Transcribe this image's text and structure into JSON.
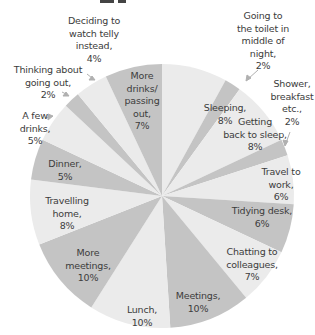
{
  "chart_data": {
    "type": "pie",
    "title": "",
    "start_angle": "12 o'clock",
    "direction": "clockwise",
    "colors": {
      "light": "#ebebeb",
      "dark": "#c4c4c4"
    },
    "categories": [
      "Sleeping",
      "Going to the toilet in middle of night",
      "Getting back to sleep",
      "Shower, breakfast etc.",
      "Travel to work",
      "Tidying desk",
      "Chatting to colleagues",
      "Meetings",
      "Lunch",
      "More meetings",
      "Travelling home",
      "Dinner",
      "A few drinks",
      "Thinking about going out",
      "Deciding to watch telly instead",
      "More drinks/ passing out"
    ],
    "values": [
      8,
      2,
      8,
      2,
      6,
      6,
      7,
      10,
      10,
      10,
      8,
      5,
      5,
      2,
      4,
      7
    ],
    "slice_colors": [
      "light",
      "dark",
      "light",
      "dark",
      "light",
      "dark",
      "light",
      "dark",
      "light",
      "dark",
      "light",
      "dark",
      "light",
      "dark",
      "light",
      "dark"
    ],
    "unit": "%"
  },
  "labels": [
    {
      "text": "Sleeping,\n8%",
      "x": 195,
      "y": 102,
      "w": 60
    },
    {
      "text": "Going to\nthe toilet in\nmiddle of\nnight,\n2%",
      "x": 228,
      "y": 10,
      "w": 70
    },
    {
      "text": "Getting\nback to sleep,\n8%",
      "x": 210,
      "y": 116,
      "w": 90
    },
    {
      "text": "Shower,\nbreakfast\netc.,\n2%",
      "x": 265,
      "y": 78,
      "w": 54
    },
    {
      "text": "Travel to\nwork,\n6%",
      "x": 246,
      "y": 166,
      "w": 70
    },
    {
      "text": "Tidying desk,\n6%",
      "x": 222,
      "y": 205,
      "w": 80
    },
    {
      "text": "Chatting to\ncolleagues,\n7%",
      "x": 212,
      "y": 246,
      "w": 80
    },
    {
      "text": "Meetings,\n10%",
      "x": 168,
      "y": 290,
      "w": 60
    },
    {
      "text": "Lunch,\n10%",
      "x": 117,
      "y": 304,
      "w": 50
    },
    {
      "text": "More\nmeetings,\n10%",
      "x": 58,
      "y": 247,
      "w": 60
    },
    {
      "text": "Travelling\nhome,\n8%",
      "x": 37,
      "y": 195,
      "w": 60
    },
    {
      "text": "Dinner,\n5%",
      "x": 40,
      "y": 158,
      "w": 50
    },
    {
      "text": "A few\ndrinks,\n5%",
      "x": 12,
      "y": 110,
      "w": 46
    },
    {
      "text": "Thinking about\ngoing out,\n2%",
      "x": 4,
      "y": 64,
      "w": 88
    },
    {
      "text": "Deciding to\nwatch telly\ninstead,\n4%",
      "x": 56,
      "y": 15,
      "w": 76
    },
    {
      "text": "More\ndrinks/\npassing\nout,\n7%",
      "x": 122,
      "y": 70,
      "w": 40
    }
  ]
}
